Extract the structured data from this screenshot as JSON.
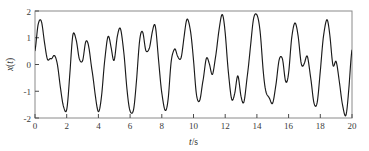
{
  "chart_data": {
    "type": "line",
    "title": "",
    "subtitle": "",
    "xlabel": "t/s",
    "xlabel_italic_part": "t",
    "xlabel_rest": "/s",
    "ylabel": "x(t)",
    "ylabel_italic_part": "x",
    "ylabel_paren_open": "(",
    "ylabel_var": "t",
    "ylabel_paren_close": ")",
    "xlim": [
      0,
      20
    ],
    "ylim": [
      -2,
      2
    ],
    "xticks": [
      0,
      2,
      4,
      6,
      8,
      10,
      12,
      14,
      16,
      18,
      20
    ],
    "xticklabels": [
      "0",
      "2",
      "4",
      "6",
      "8",
      "10",
      "12",
      "14",
      "16",
      "18",
      "20"
    ],
    "yticks": [
      -2,
      -1,
      0,
      1,
      2
    ],
    "yticklabels": [
      "-2",
      "-1",
      "0",
      "1",
      "2"
    ],
    "grid": false,
    "legend": null,
    "legend_position": "none",
    "line_color": "#1a1a1a",
    "axis_color": "#8a8a8a",
    "background_color": "#ffffff",
    "series": [
      {
        "name": "x(t)",
        "description": "multi-component quasi-periodic vibration signal, sum of sinusoids",
        "components": [
          {
            "amplitude": 1.0,
            "frequency_hz": 0.6,
            "phase_rad": 0.0
          },
          {
            "amplitude": 0.65,
            "frequency_hz": 1.35,
            "phase_rad": 1.1
          },
          {
            "amplitude": 0.45,
            "frequency_hz": 2.1,
            "phase_rad": 2.3
          },
          {
            "amplitude": 0.22,
            "frequency_hz": 0.23,
            "phase_rad": 0.5
          }
        ],
        "sample_interval_s": 0.02,
        "value_range": [
          -2.0,
          2.05
        ],
        "x": [
          0.0,
          0.2,
          0.4,
          0.6,
          0.8,
          1.0,
          1.2,
          1.4,
          1.6,
          1.8,
          2.0,
          2.2,
          2.4,
          2.6,
          2.8,
          3.0,
          3.2,
          3.4,
          3.6,
          3.8,
          4.0,
          4.2,
          4.4,
          4.6,
          4.8,
          5.0,
          5.2,
          5.4,
          5.6,
          5.8,
          6.0,
          6.2,
          6.4,
          6.6,
          6.8,
          7.0,
          7.2,
          7.4,
          7.6,
          7.8,
          8.0,
          8.2,
          8.4,
          8.6,
          8.8,
          9.0,
          9.2,
          9.4,
          9.6,
          9.8,
          10.0,
          10.2,
          10.4,
          10.6,
          10.8,
          11.0,
          11.2,
          11.4,
          11.6,
          11.8,
          12.0,
          12.2,
          12.4,
          12.6,
          12.8,
          13.0,
          13.2,
          13.4,
          13.6,
          13.8,
          14.0,
          14.2,
          14.4,
          14.6,
          14.8,
          15.0,
          15.2,
          15.4,
          15.6,
          15.8,
          16.0,
          16.2,
          16.4,
          16.6,
          16.8,
          17.0,
          17.2,
          17.4,
          17.6,
          17.8,
          18.0,
          18.2,
          18.4,
          18.6,
          18.8,
          19.0,
          19.2,
          19.4,
          19.6,
          19.8,
          20.0
        ],
        "y": [
          0.45,
          1.62,
          1.7,
          0.85,
          0.05,
          0.3,
          0.62,
          0.05,
          -0.95,
          -1.85,
          -1.95,
          -0.55,
          1.18,
          1.25,
          0.35,
          0.28,
          1.02,
          0.8,
          -0.35,
          -1.55,
          -1.98,
          -1.3,
          0.25,
          1.22,
          0.85,
          0.25,
          0.95,
          1.38,
          0.45,
          -1.05,
          -1.98,
          -1.85,
          -0.45,
          0.95,
          1.3,
          0.52,
          0.62,
          1.32,
          1.58,
          0.45,
          -1.1,
          -1.92,
          -1.5,
          0.1,
          0.52,
          0.1,
          0.35,
          1.25,
          1.98,
          1.5,
          0.2,
          -1.35,
          -1.8,
          -0.75,
          0.3,
          0.1,
          -0.3,
          0.48,
          1.62,
          1.98,
          1.2,
          -0.35,
          -1.48,
          -1.2,
          -0.45,
          -1.1,
          -1.52,
          -0.6,
          0.7,
          1.85,
          2.02,
          1.28,
          -0.1,
          -1.05,
          -1.45,
          -1.62,
          -0.92,
          0.15,
          0.05,
          -0.65,
          -0.15,
          1.25,
          1.88,
          1.25,
          0.1,
          -0.15,
          0.12,
          -0.55,
          -1.62,
          -1.55,
          -0.25,
          1.35,
          1.82,
          1.0,
          -0.1,
          0.05,
          -0.7,
          -1.7,
          -1.95,
          -0.85,
          0.52
        ]
      }
    ],
    "plot_area": {
      "left_px": 35,
      "top_px": 11,
      "right_px": 352,
      "bottom_px": 118
    }
  }
}
